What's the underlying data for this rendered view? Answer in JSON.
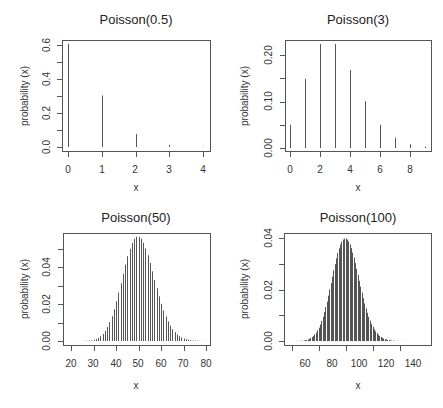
{
  "chart_data": [
    {
      "type": "bar",
      "title": "Poisson(0.5)",
      "xlabel": "x",
      "ylabel": "probability (x)",
      "x": [
        0,
        1,
        2,
        3,
        4
      ],
      "values": [
        0.607,
        0.303,
        0.076,
        0.013,
        0.002
      ],
      "xlim": [
        0,
        4
      ],
      "ylim": [
        0,
        0.6
      ],
      "xticks": [
        0,
        1,
        2,
        3,
        4
      ],
      "yticks": [
        0.0,
        0.2,
        0.4,
        0.6
      ],
      "ytick_labels": [
        "0.0",
        "0.2",
        "0.4",
        "0.6"
      ],
      "ytick_minor": [
        0.1,
        0.3,
        0.5
      ],
      "grid": false
    },
    {
      "type": "bar",
      "title": "Poisson(3)",
      "xlabel": "x",
      "ylabel": "probability (x)",
      "x": [
        0,
        1,
        2,
        3,
        4,
        5,
        6,
        7,
        8,
        9
      ],
      "values": [
        0.05,
        0.149,
        0.224,
        0.224,
        0.168,
        0.101,
        0.05,
        0.022,
        0.008,
        0.003
      ],
      "xlim": [
        0,
        9
      ],
      "ylim": [
        0,
        0.224
      ],
      "xticks": [
        0,
        2,
        4,
        6,
        8
      ],
      "yticks": [
        0.0,
        0.1,
        0.2
      ],
      "ytick_labels": [
        "0.00",
        "0.10",
        "0.20"
      ],
      "ytick_minor": [
        0.05,
        0.15
      ],
      "grid": false
    },
    {
      "type": "bar",
      "title": "Poisson(50)",
      "xlabel": "x",
      "ylabel": "probability (x)",
      "x_range": [
        20,
        80
      ],
      "distribution": {
        "lambda": 50
      },
      "peak_value": 0.0563,
      "xlim": [
        20,
        80
      ],
      "ylim": [
        0,
        0.0563
      ],
      "xticks": [
        20,
        30,
        40,
        50,
        60,
        70,
        80
      ],
      "yticks": [
        0.0,
        0.02,
        0.04
      ],
      "ytick_labels": [
        "0.00",
        "0.02",
        "0.04"
      ],
      "ytick_minor": [
        0.01,
        0.03,
        0.05
      ],
      "grid": false
    },
    {
      "type": "bar",
      "title": "Poisson(100)",
      "xlabel": "x",
      "ylabel": "probability (x)",
      "x_range": [
        50,
        150
      ],
      "distribution": {
        "lambda": 100
      },
      "peak_value": 0.0399,
      "xlim": [
        50,
        150
      ],
      "ylim": [
        0,
        0.0399
      ],
      "xticks": [
        60,
        80,
        100,
        120,
        140
      ],
      "yticks": [
        0.0,
        0.02,
        0.04
      ],
      "ytick_labels": [
        "0.00",
        "0.02",
        "0.04"
      ],
      "ytick_minor": [
        0.01,
        0.03
      ],
      "grid": false
    }
  ],
  "panels": [
    {
      "title": "Poisson(0.5)",
      "xlabel": "x",
      "ylabel": "probability (x)",
      "xtick_labels": [
        "0",
        "1",
        "2",
        "3",
        "4"
      ],
      "ytick_labels": [
        "0.0",
        "0.2",
        "0.4",
        "0.6"
      ]
    },
    {
      "title": "Poisson(3)",
      "xlabel": "x",
      "ylabel": "probability (x)",
      "xtick_labels": [
        "0",
        "2",
        "4",
        "6",
        "8"
      ],
      "ytick_labels": [
        "0.00",
        "0.10",
        "0.20"
      ]
    },
    {
      "title": "Poisson(50)",
      "xlabel": "x",
      "ylabel": "probability (x)",
      "xtick_labels": [
        "20",
        "30",
        "40",
        "50",
        "60",
        "70",
        "80"
      ],
      "ytick_labels": [
        "0.00",
        "0.02",
        "0.04"
      ]
    },
    {
      "title": "Poisson(100)",
      "xlabel": "x",
      "ylabel": "probability (x)",
      "xtick_labels": [
        "60",
        "80",
        "100",
        "120",
        "140"
      ],
      "ytick_labels": [
        "0.00",
        "0.02",
        "0.04"
      ]
    }
  ],
  "colors": {
    "bar": "#555555",
    "axis": "#555555",
    "text": "#222222"
  }
}
